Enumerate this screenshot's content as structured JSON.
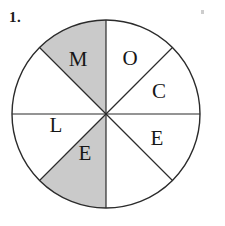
{
  "page": {
    "width": 225,
    "height": 226,
    "background_color": "#ffffff"
  },
  "problem": {
    "number_label": "1."
  },
  "artifact": {
    "name": "stray-speck",
    "color": "#c4c4c4"
  },
  "chart_data": {
    "type": "pie",
    "title": "",
    "subtitle": "",
    "xlabel": "",
    "ylabel": "",
    "legend_position": "none",
    "grid": false,
    "geometry": {
      "center_x": 106,
      "center_y": 114,
      "radius": 94,
      "outline_color": "#2b2b2b",
      "outline_width": 1.4,
      "spoke_color": "#2b2b2b",
      "spoke_width": 1.2,
      "sector_count": 8,
      "sector_angle_degrees": 45
    },
    "colors": {
      "unshaded_fill": "#ffffff",
      "shaded_fill": "#cacaca"
    },
    "categories": [
      "M",
      "O",
      "C",
      "E",
      "shaded-bottom-right",
      "E",
      "L",
      "shaded-upper-left"
    ],
    "values": [
      45,
      45,
      45,
      45,
      45,
      45,
      45,
      45
    ],
    "slices": [
      {
        "index": 0,
        "label": "M",
        "start_angle": 270,
        "end_angle": 315,
        "sweep_degrees": 45,
        "shaded": false,
        "fill": "#ffffff",
        "label_x": 78,
        "label_y": 61
      },
      {
        "index": 1,
        "label": "O",
        "start_angle": 315,
        "end_angle": 360,
        "sweep_degrees": 45,
        "shaded": false,
        "fill": "#ffffff",
        "label_x": 130,
        "label_y": 60
      },
      {
        "index": 2,
        "label": "C",
        "start_angle": 0,
        "end_angle": 45,
        "sweep_degrees": 45,
        "shaded": false,
        "fill": "#ffffff",
        "label_x": 159,
        "label_y": 93
      },
      {
        "index": 3,
        "label": "E",
        "start_angle": 45,
        "end_angle": 90,
        "sweep_degrees": 45,
        "shaded": false,
        "fill": "#ffffff",
        "label_x": 157,
        "label_y": 140
      },
      {
        "index": 4,
        "label": "",
        "start_angle": 90,
        "end_angle": 135,
        "sweep_degrees": 45,
        "shaded": true,
        "fill": "#cacaca",
        "label_x": 132,
        "label_y": 165
      },
      {
        "index": 5,
        "label": "E",
        "start_angle": 135,
        "end_angle": 180,
        "sweep_degrees": 45,
        "shaded": false,
        "fill": "#ffffff",
        "label_x": 85,
        "label_y": 155
      },
      {
        "index": 6,
        "label": "L",
        "start_angle": 180,
        "end_angle": 225,
        "sweep_degrees": 45,
        "shaded": false,
        "fill": "#ffffff",
        "label_x": 56,
        "label_y": 127
      },
      {
        "index": 7,
        "label": "",
        "start_angle": 225,
        "end_angle": 270,
        "sweep_degrees": 45,
        "shaded": true,
        "fill": "#cacaca",
        "label_x": 52,
        "label_y": 88
      }
    ],
    "annotations": [
      {
        "text": "1.",
        "x": 12,
        "y": 22
      }
    ]
  }
}
